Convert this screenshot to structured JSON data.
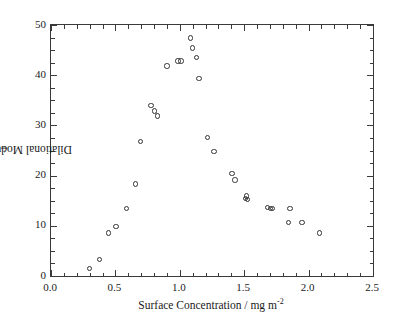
{
  "chart_data": {
    "type": "scatter",
    "title": "",
    "xlabel": "Surface Concentration / mg m-2",
    "xlabel_base": "Surface Concentration / mg m",
    "xlabel_exp": "-2",
    "ylabel": "Dilational Modulus / mN m-1",
    "ylabel_base": "Dilational Modulus / mN m",
    "ylabel_exp": "-1",
    "xlim": [
      0.0,
      2.5
    ],
    "ylim": [
      0,
      50
    ],
    "x_major_step": 0.5,
    "x_minor_step": 0.1,
    "y_major_step": 10,
    "y_minor_step": 2.5,
    "grid": false,
    "legend": null,
    "marker": "open-circle",
    "marker_color": "#333333",
    "xticklabels": [
      "0.0",
      "0.5",
      "1.0",
      "1.5",
      "2.0",
      "2.5"
    ],
    "xtickvalues": [
      0.0,
      0.5,
      1.0,
      1.5,
      2.0,
      2.5
    ],
    "yticklabels": [
      "0",
      "10",
      "20",
      "30",
      "40",
      "50"
    ],
    "ytickvalues": [
      0,
      10,
      20,
      30,
      40,
      50
    ],
    "series": [
      {
        "name": "Dilational modulus",
        "points": [
          [
            0.3,
            1.5
          ],
          [
            0.375,
            3.3
          ],
          [
            0.445,
            8.6
          ],
          [
            0.505,
            9.9
          ],
          [
            0.585,
            13.4
          ],
          [
            0.655,
            18.3
          ],
          [
            0.695,
            26.8
          ],
          [
            0.775,
            34.0
          ],
          [
            0.805,
            32.9
          ],
          [
            0.825,
            31.9
          ],
          [
            0.9,
            41.8
          ],
          [
            0.985,
            42.8
          ],
          [
            1.01,
            42.8
          ],
          [
            1.085,
            47.4
          ],
          [
            1.1,
            45.4
          ],
          [
            1.13,
            43.5
          ],
          [
            1.15,
            39.3
          ],
          [
            1.215,
            27.6
          ],
          [
            1.265,
            24.8
          ],
          [
            1.405,
            20.4
          ],
          [
            1.43,
            19.1
          ],
          [
            1.51,
            15.4
          ],
          [
            1.52,
            15.9
          ],
          [
            1.525,
            15.2
          ],
          [
            1.68,
            13.6
          ],
          [
            1.705,
            13.4
          ],
          [
            1.72,
            13.4
          ],
          [
            1.845,
            10.7
          ],
          [
            1.855,
            13.5
          ],
          [
            1.95,
            10.6
          ],
          [
            2.085,
            8.6
          ]
        ]
      }
    ]
  }
}
